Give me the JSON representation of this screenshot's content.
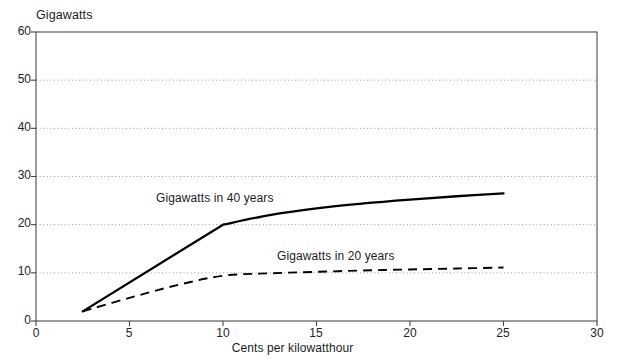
{
  "chart_data": {
    "type": "line",
    "title": "",
    "ylabel": "Gigawatts",
    "xlabel": "Cents per kilowatthour",
    "xlim": [
      0,
      30
    ],
    "ylim": [
      0,
      60
    ],
    "x_ticks": [
      0,
      5,
      10,
      15,
      20,
      25,
      30
    ],
    "y_ticks": [
      0,
      10,
      20,
      30,
      40,
      50,
      60
    ],
    "grid": "horizontal-dotted",
    "legend_position": "inline-annotations",
    "series": [
      {
        "name": "Gigawatts in 40 years",
        "style": "solid",
        "color": "#000000",
        "label_x": 9.0,
        "label_y": 24.0,
        "x": [
          2.5,
          5.0,
          7.5,
          10.0,
          12.5,
          15.0,
          17.5,
          20.0,
          22.5,
          25.0
        ],
        "y": [
          2.0,
          8.0,
          14.0,
          20.0,
          22.0,
          23.4,
          24.4,
          25.2,
          25.9,
          26.5
        ]
      },
      {
        "name": "Gigawatts in 20 years",
        "style": "dashed",
        "color": "#000000",
        "label_x": 13.0,
        "label_y": 13.5,
        "x": [
          2.5,
          5.0,
          7.5,
          10.0,
          12.5,
          15.0,
          17.5,
          20.0,
          22.5,
          25.0
        ],
        "y": [
          2.0,
          4.8,
          7.4,
          9.4,
          9.9,
          10.2,
          10.5,
          10.7,
          10.9,
          11.1
        ]
      }
    ]
  },
  "axes": {
    "y_title": "Gigawatts",
    "x_title": "Cents per kilowatthour",
    "y_tick_labels": [
      "60",
      "50",
      "40",
      "30",
      "20",
      "10",
      "0"
    ],
    "x_tick_labels": [
      "0",
      "5",
      "10",
      "15",
      "20",
      "25",
      "30"
    ]
  },
  "annotations": {
    "series_40": "Gigawatts in 40 years",
    "series_20": "Gigawatts in 20 years"
  },
  "colors": {
    "axis": "#444444",
    "grid": "#9a9a9a",
    "line": "#000000",
    "text": "#1c1c1c",
    "background": "#ffffff"
  }
}
